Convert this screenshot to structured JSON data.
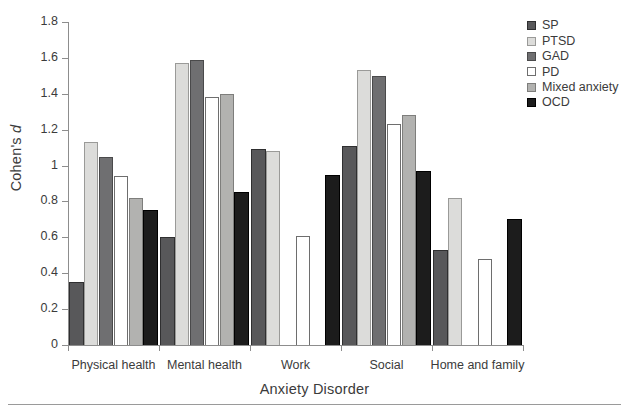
{
  "chart_data": {
    "type": "bar",
    "title": "",
    "xlabel": "Anxiety Disorder",
    "ylabel": "Cohen's d",
    "ylim": [
      0,
      1.8
    ],
    "ytick_labels": [
      "0",
      "0.2",
      "0.4",
      "0.6",
      "0.8",
      "1",
      "1.2",
      "1.4",
      "1.6",
      "1.8"
    ],
    "ytick_values": [
      0,
      0.2,
      0.4,
      0.6,
      0.8,
      1.0,
      1.2,
      1.4,
      1.6,
      1.8
    ],
    "grid": false,
    "legend_position": "top-right",
    "categories": [
      "Physical health",
      "Mental health",
      "Work",
      "Social",
      "Home and family"
    ],
    "series": [
      {
        "name": "SP",
        "color": "#58585a",
        "border": "#2f2f30",
        "values": [
          0.35,
          0.6,
          1.09,
          1.11,
          0.53
        ]
      },
      {
        "name": "PTSD",
        "color": "#dcdcda",
        "border": "#9a9a98",
        "values": [
          1.13,
          1.57,
          1.08,
          1.53,
          0.82
        ]
      },
      {
        "name": "GAD",
        "color": "#6f6f71",
        "border": "#4a4a4b",
        "values": [
          1.05,
          1.59,
          null,
          1.5,
          null
        ]
      },
      {
        "name": "PD",
        "color": "#ffffff",
        "border": "#6e6e6e",
        "values": [
          0.94,
          1.38,
          0.61,
          1.23,
          0.48
        ]
      },
      {
        "name": "Mixed anxiety",
        "color": "#b2b2b0",
        "border": "#7e7e7c",
        "values": [
          0.82,
          1.4,
          null,
          1.28,
          null
        ]
      },
      {
        "name": "OCD",
        "color": "#1c1c1c",
        "border": "#000000",
        "values": [
          0.75,
          0.85,
          0.95,
          0.97,
          0.7
        ]
      }
    ]
  },
  "axes": {
    "ylabel_prefix": "Cohen's ",
    "ylabel_italic": "d",
    "xlabel": "Anxiety Disorder"
  },
  "legend": {
    "items": [
      {
        "label": "SP"
      },
      {
        "label": "PTSD"
      },
      {
        "label": "GAD"
      },
      {
        "label": "PD"
      },
      {
        "label": "Mixed anxiety"
      },
      {
        "label": "OCD"
      }
    ]
  }
}
